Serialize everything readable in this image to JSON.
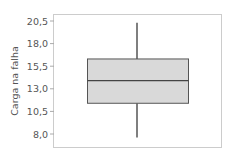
{
  "chart_data": {
    "type": "box",
    "title": "",
    "xlabel": "",
    "ylabel": "Carga na falha",
    "ylim": [
      7.2,
      21.3
    ],
    "yticks": [
      8.0,
      10.5,
      13.0,
      15.5,
      18.0,
      20.5
    ],
    "ytick_labels": [
      "8,0",
      "10,5",
      "13,0",
      "15,5",
      "18,0",
      "20,5"
    ],
    "grid": false,
    "legend": null,
    "series": [
      {
        "name": "Carga na falha",
        "whisker_low": 7.6,
        "q1": 11.4,
        "median": 13.9,
        "q3": 16.3,
        "whisker_high": 20.3
      }
    ],
    "colors": {
      "box_fill": "#d9d9d9",
      "box_stroke": "#555555",
      "whisker": "#555555",
      "frame": "#cccccc",
      "text": "#555555"
    }
  }
}
